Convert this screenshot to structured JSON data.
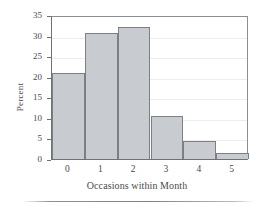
{
  "chart_data": {
    "type": "bar",
    "title": "",
    "subtitle": "",
    "xlabel": "Occasions within Month",
    "ylabel": "Percent",
    "categories": [
      "0",
      "1",
      "2",
      "3",
      "4",
      "5"
    ],
    "values": [
      20.8,
      30.6,
      32.0,
      10.5,
      4.4,
      1.5
    ],
    "series": [
      {
        "name": "Percent",
        "values": [
          20.8,
          30.6,
          32.0,
          10.5,
          4.4,
          1.5
        ]
      }
    ],
    "ylim": [
      0,
      35
    ],
    "yticks": [
      0,
      5,
      10,
      15,
      20,
      25,
      30,
      35
    ],
    "ytick_labels": [
      "0",
      "5",
      "10",
      "15",
      "20",
      "25",
      "30",
      "35"
    ],
    "xticks": [
      0,
      1,
      2,
      3,
      4,
      5
    ],
    "xtick_labels": [
      "0",
      "1",
      "2",
      "3",
      "4",
      "5"
    ],
    "grid": true,
    "grid_axis": "y",
    "legend": false,
    "legend_position": "none",
    "bar_fill_color": "#c8ccd0",
    "bar_edge_color": "#7c7f83",
    "axis_color": "#6f7275",
    "grid_color": "#ededf0",
    "background_color": "#ffffff"
  }
}
